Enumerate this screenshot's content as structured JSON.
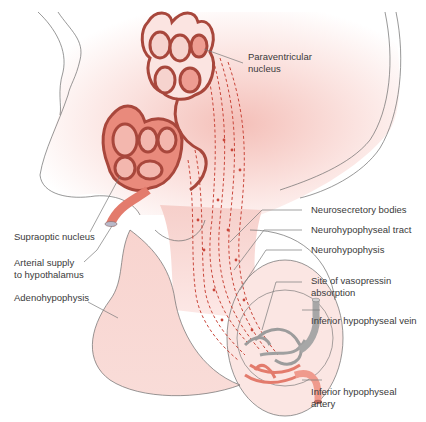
{
  "diagram": {
    "colors": {
      "tissue_fill": "#fbe3e1",
      "tissue_fill_strong": "#f2b6b0",
      "neuron_fill": "#e98a7c",
      "neuron_stroke": "#a8473c",
      "cell_nucleus": "#f6c9c2",
      "artery": "#e37b6c",
      "vein": "#a7a7a7",
      "fiber": "#c9463a",
      "outline": "#6b6b6b",
      "label_text": "#3a3a3a",
      "leader_line": "#7a7a7a"
    },
    "labels": {
      "paraventricular": [
        "Paraventricular",
        "nucleus"
      ],
      "supraoptic": "Supraoptic nucleus",
      "arterial_supply": [
        "Arterial supply",
        "to hypothalamus"
      ],
      "adenohypophysis": "Adenohypophysis",
      "neurosecretory_bodies": "Neurosecretory bodies",
      "neurohypophyseal_tract": "Neurohypophyseal tract",
      "neurohypophysis": "Neurohypophysis",
      "vasopressin_site": [
        "Site of vasopressin",
        "absorption"
      ],
      "inferior_vein": "Inferior hypophyseal vein",
      "inferior_artery": [
        "Inferior hypophyseal",
        "artery"
      ]
    }
  }
}
